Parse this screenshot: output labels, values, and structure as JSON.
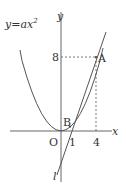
{
  "diagram": {
    "curve_label": "y=ax",
    "curve_exponent": "2",
    "axis_x_label": "x",
    "axis_y_label": "y",
    "origin_label": "O",
    "tick_1": "1",
    "tick_4": "4",
    "tick_8": "8",
    "point_a": "A",
    "point_b": "B",
    "line_label": "l",
    "colors": {
      "stroke": "#555555",
      "text": "#333333"
    }
  }
}
